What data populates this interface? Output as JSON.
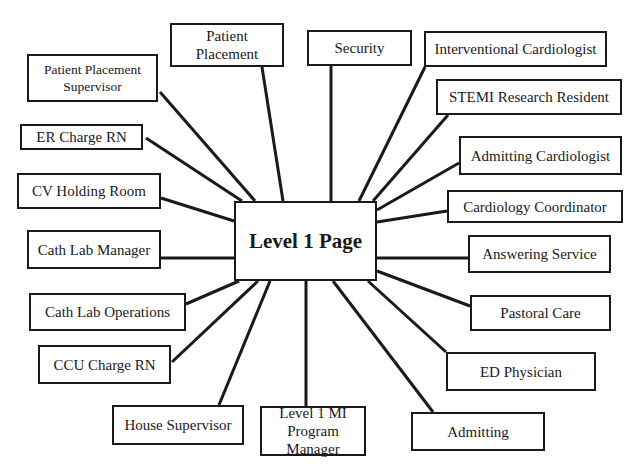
{
  "diagram": {
    "type": "hub-and-spoke",
    "colors": {
      "line": "#1a1a1a",
      "box_border": "#1a1a1a",
      "text": "#1a1a1a",
      "background": "#ffffff"
    },
    "center": {
      "label": "Level 1 Page",
      "box": [
        234,
        201,
        377,
        281
      ]
    },
    "nodes": [
      {
        "id": "patient-placement-supervisor",
        "label": "Patient Placement\nSupervisor",
        "box": [
          27,
          54,
          158,
          102
        ],
        "anchor": [
          160,
          92
        ],
        "hub": [
          255,
          201
        ],
        "size": "small"
      },
      {
        "id": "patient-placement",
        "label": "Patient\nPlacement",
        "box": [
          170,
          23,
          284,
          67
        ],
        "anchor": [
          262,
          67
        ],
        "hub": [
          283,
          201
        ],
        "size": "normal"
      },
      {
        "id": "security",
        "label": "Security",
        "box": [
          307,
          30,
          412,
          66
        ],
        "anchor": [
          331,
          66
        ],
        "hub": [
          331,
          201
        ],
        "size": "normal"
      },
      {
        "id": "interventional-cardiologist",
        "label": "Interventional Cardiologist",
        "box": [
          424,
          31,
          607,
          67
        ],
        "anchor": [
          425,
          67
        ],
        "hub": [
          359,
          201
        ],
        "size": "normal"
      },
      {
        "id": "stemi-research-resident",
        "label": "STEMI Research Resident",
        "box": [
          436,
          79,
          622,
          115
        ],
        "anchor": [
          448,
          115
        ],
        "hub": [
          373,
          201
        ],
        "size": "normal"
      },
      {
        "id": "admitting-cardiologist",
        "label": "Admitting Cardiologist",
        "box": [
          459,
          136,
          622,
          175
        ],
        "anchor": [
          459,
          163
        ],
        "hub": [
          377,
          210
        ],
        "size": "normal"
      },
      {
        "id": "cardiology-coordinator",
        "label": "Cardiology Coordinator",
        "box": [
          447,
          190,
          623,
          223
        ],
        "anchor": [
          447,
          211
        ],
        "hub": [
          377,
          222
        ],
        "size": "normal"
      },
      {
        "id": "answering-service",
        "label": "Answering Service",
        "box": [
          468,
          235,
          611,
          273
        ],
        "anchor": [
          468,
          258
        ],
        "hub": [
          377,
          258
        ],
        "size": "normal"
      },
      {
        "id": "pastoral-care",
        "label": "Pastoral Care",
        "box": [
          470,
          295,
          611,
          331
        ],
        "anchor": [
          470,
          306
        ],
        "hub": [
          377,
          271
        ],
        "size": "normal"
      },
      {
        "id": "ed-physician",
        "label": "ED Physician",
        "box": [
          446,
          352,
          596,
          391
        ],
        "anchor": [
          446,
          352
        ],
        "hub": [
          368,
          281
        ],
        "size": "normal"
      },
      {
        "id": "admitting",
        "label": "Admitting",
        "box": [
          411,
          412,
          545,
          451
        ],
        "anchor": [
          433,
          412
        ],
        "hub": [
          333,
          281
        ],
        "size": "normal"
      },
      {
        "id": "level-1-mi-program-manager",
        "label": "Level 1 MI\nProgram Manager",
        "box": [
          260,
          406,
          366,
          456
        ],
        "anchor": [
          306,
          406
        ],
        "hub": [
          306,
          281
        ],
        "size": "normal"
      },
      {
        "id": "house-supervisor",
        "label": "House Supervisor",
        "box": [
          112,
          405,
          244,
          445
        ],
        "anchor": [
          219,
          405
        ],
        "hub": [
          270,
          281
        ],
        "size": "normal"
      },
      {
        "id": "ccu-charge-rn",
        "label": "CCU Charge RN",
        "box": [
          38,
          345,
          171,
          384
        ],
        "anchor": [
          172,
          362
        ],
        "hub": [
          258,
          281
        ],
        "size": "normal"
      },
      {
        "id": "cath-lab-operations",
        "label": "Cath Lab Operations",
        "box": [
          29,
          293,
          186,
          331
        ],
        "anchor": [
          186,
          304
        ],
        "hub": [
          239,
          281
        ],
        "size": "normal"
      },
      {
        "id": "cath-lab-manager",
        "label": "Cath Lab Manager",
        "box": [
          27,
          230,
          161,
          269
        ],
        "anchor": [
          161,
          258
        ],
        "hub": [
          234,
          258
        ],
        "size": "normal"
      },
      {
        "id": "cv-holding-room",
        "label": "CV Holding Room",
        "box": [
          17,
          173,
          161,
          209
        ],
        "anchor": [
          161,
          198
        ],
        "hub": [
          234,
          221
        ],
        "size": "normal"
      },
      {
        "id": "er-charge-rn",
        "label": "ER Charge RN",
        "box": [
          20,
          124,
          143,
          150
        ],
        "anchor": [
          146,
          138
        ],
        "hub": [
          242,
          201
        ],
        "size": "normal"
      }
    ]
  }
}
